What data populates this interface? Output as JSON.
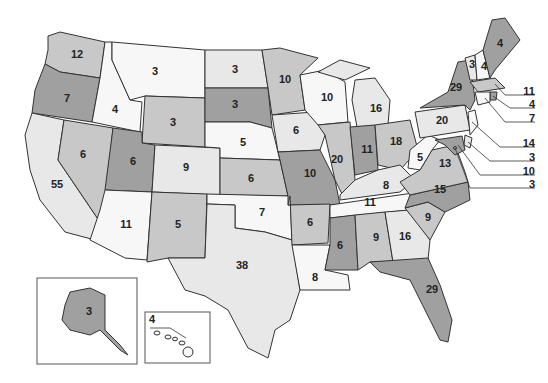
{
  "shades": {
    "white": "#f7f7f7",
    "light": "#e8e8e8",
    "medium": "#c8c8c8",
    "dark": "#a0a0a0"
  },
  "states": {
    "WA": {
      "name": "Washington",
      "value": "12",
      "shade": "medium"
    },
    "OR": {
      "name": "Oregon",
      "value": "7",
      "shade": "dark"
    },
    "CA": {
      "name": "California",
      "value": "55",
      "shade": "light"
    },
    "ID": {
      "name": "Idaho",
      "value": "4",
      "shade": "white"
    },
    "NV": {
      "name": "Nevada",
      "value": "6",
      "shade": "medium"
    },
    "MT": {
      "name": "Montana",
      "value": "3",
      "shade": "white"
    },
    "WY": {
      "name": "Wyoming",
      "value": "3",
      "shade": "medium"
    },
    "UT": {
      "name": "Utah",
      "value": "6",
      "shade": "dark"
    },
    "AZ": {
      "name": "Arizona",
      "value": "11",
      "shade": "white"
    },
    "CO": {
      "name": "Colorado",
      "value": "9",
      "shade": "light"
    },
    "NM": {
      "name": "New Mexico",
      "value": "5",
      "shade": "medium"
    },
    "ND": {
      "name": "North Dakota",
      "value": "3",
      "shade": "light"
    },
    "SD": {
      "name": "South Dakota",
      "value": "3",
      "shade": "dark"
    },
    "NE": {
      "name": "Nebraska",
      "value": "5",
      "shade": "white"
    },
    "KS": {
      "name": "Kansas",
      "value": "6",
      "shade": "medium"
    },
    "OK": {
      "name": "Oklahoma",
      "value": "7",
      "shade": "white"
    },
    "TX": {
      "name": "Texas",
      "value": "38",
      "shade": "light"
    },
    "MN": {
      "name": "Minnesota",
      "value": "10",
      "shade": "medium"
    },
    "IA": {
      "name": "Iowa",
      "value": "6",
      "shade": "light"
    },
    "MO": {
      "name": "Missouri",
      "value": "10",
      "shade": "dark"
    },
    "AR": {
      "name": "Arkansas",
      "value": "6",
      "shade": "medium"
    },
    "LA": {
      "name": "Louisiana",
      "value": "8",
      "shade": "white"
    },
    "WI": {
      "name": "Wisconsin",
      "value": "10",
      "shade": "white"
    },
    "IL": {
      "name": "Illinois",
      "value": "20",
      "shade": "medium"
    },
    "MI": {
      "name": "Michigan",
      "value": "16",
      "shade": "light"
    },
    "IN": {
      "name": "Indiana",
      "value": "11",
      "shade": "dark"
    },
    "OH": {
      "name": "Ohio",
      "value": "18",
      "shade": "medium"
    },
    "KY": {
      "name": "Kentucky",
      "value": "8",
      "shade": "light"
    },
    "TN": {
      "name": "Tennessee",
      "value": "11",
      "shade": "white"
    },
    "MS": {
      "name": "Mississippi",
      "value": "6",
      "shade": "dark"
    },
    "AL": {
      "name": "Alabama",
      "value": "9",
      "shade": "medium"
    },
    "GA": {
      "name": "Georgia",
      "value": "16",
      "shade": "light"
    },
    "FL": {
      "name": "Florida",
      "value": "29",
      "shade": "dark"
    },
    "SC": {
      "name": "South Carolina",
      "value": "9",
      "shade": "medium"
    },
    "NC": {
      "name": "North Carolina",
      "value": "15",
      "shade": "dark"
    },
    "VA": {
      "name": "Virginia",
      "value": "13",
      "shade": "medium"
    },
    "WV": {
      "name": "West Virginia",
      "value": "5",
      "shade": "white"
    },
    "PA": {
      "name": "Pennsylvania",
      "value": "20",
      "shade": "light"
    },
    "NY": {
      "name": "New York",
      "value": "29",
      "shade": "dark"
    },
    "VT": {
      "name": "Vermont",
      "value": "3",
      "shade": "light"
    },
    "NH": {
      "name": "New Hampshire",
      "value": "4",
      "shade": "white"
    },
    "ME": {
      "name": "Maine",
      "value": "4",
      "shade": "dark"
    },
    "MA": {
      "name": "Massachusetts",
      "value": "11",
      "shade": "medium"
    },
    "RI": {
      "name": "Rhode Island",
      "value": "4",
      "shade": "dark"
    },
    "CT": {
      "name": "Connecticut",
      "value": "7",
      "shade": "white"
    },
    "NJ": {
      "name": "New Jersey",
      "value": "14",
      "shade": "white"
    },
    "DE": {
      "name": "Delaware",
      "value": "3",
      "shade": "light"
    },
    "MD": {
      "name": "Maryland",
      "value": "10",
      "shade": "dark"
    },
    "DC": {
      "name": "District of Columbia",
      "value": "3",
      "shade": "dark"
    },
    "AK": {
      "name": "Alaska",
      "value": "3",
      "shade": "dark"
    },
    "HI": {
      "name": "Hawaii",
      "value": "4",
      "shade": "white"
    }
  },
  "callouts": [
    {
      "state": "MA",
      "value": "11"
    },
    {
      "state": "RI",
      "value": "4"
    },
    {
      "state": "CT",
      "value": "7"
    },
    {
      "state": "NJ",
      "value": "14"
    },
    {
      "state": "DE",
      "value": "3"
    },
    {
      "state": "MD",
      "value": "10"
    },
    {
      "state": "DC",
      "value": "3"
    }
  ]
}
